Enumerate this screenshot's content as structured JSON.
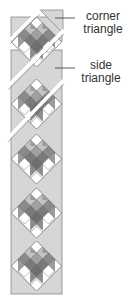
{
  "diagram": {
    "type": "quilt-assembly-diagram",
    "block_count": 5,
    "colors": {
      "triangle_fill": "#d6d6d6",
      "triangle_stroke": "#8a8a8a",
      "light_patch": "#ffffff",
      "medium_patch": "#a8a8a8",
      "dark_patch": "#7c7c7c",
      "outline": "#555555"
    }
  },
  "labels": {
    "corner": {
      "line1": "corner",
      "line2": "triangle"
    },
    "side": {
      "line1": "side",
      "line2": "triangle"
    }
  }
}
